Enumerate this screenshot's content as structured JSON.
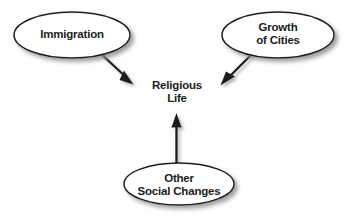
{
  "diagram": {
    "type": "concept-map",
    "background_color": "#ffffff",
    "stroke_color": "#1c1c1c",
    "fill_color": "#ffffff",
    "shadow_color": "#9a9a9a",
    "text_color": "#1c1c1c",
    "center": {
      "label": "Religious\nLife",
      "line1": "Religious",
      "line2": "Life",
      "shape": "none"
    },
    "nodes": [
      {
        "id": "immigration",
        "label": "Immigration",
        "shape": "ellipse",
        "cx": 72,
        "cy": 35,
        "rx": 58,
        "ry": 23
      },
      {
        "id": "growth-of-cities",
        "label": "Growth\nof Cities",
        "line1": "Growth",
        "line2": "of Cities",
        "shape": "ellipse",
        "cx": 278,
        "cy": 35,
        "rx": 56,
        "ry": 23
      },
      {
        "id": "other-social-changes",
        "label": "Other\nSocial Changes",
        "line1": "Other",
        "line2": "Social Changes",
        "shape": "ellipse",
        "cx": 179,
        "cy": 184,
        "rx": 55,
        "ry": 21
      }
    ],
    "arrows": [
      {
        "id": "immigration-to-religious-life",
        "from": "immigration",
        "to": "center",
        "direction": "down-right"
      },
      {
        "id": "growth-to-religious-life",
        "from": "growth-of-cities",
        "to": "center",
        "direction": "down-left"
      },
      {
        "id": "other-to-religious-life",
        "from": "other-social-changes",
        "to": "center",
        "direction": "up"
      }
    ]
  }
}
